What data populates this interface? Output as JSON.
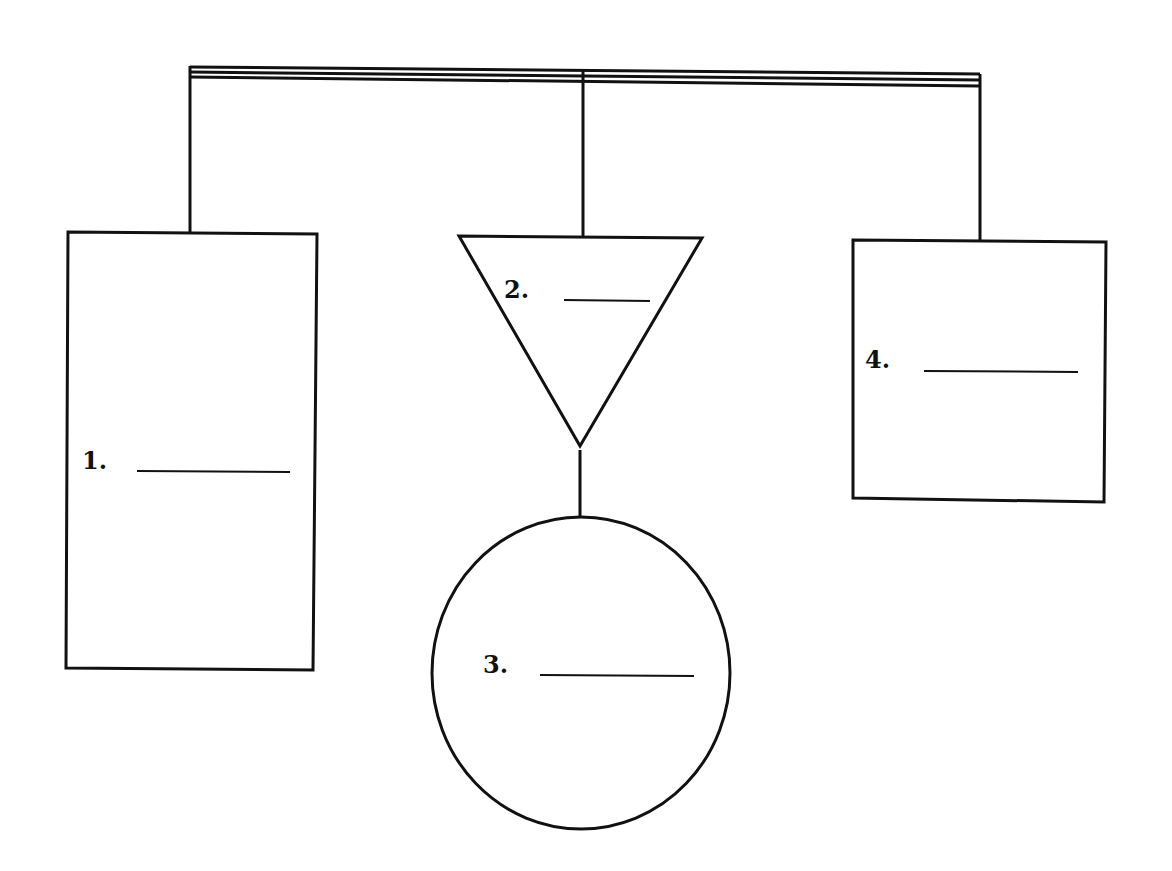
{
  "diagram": {
    "type": "hierarchy-blank-worksheet",
    "shapes": [
      {
        "id": 1,
        "shape": "rectangle",
        "label": "1.",
        "blank": ""
      },
      {
        "id": 2,
        "shape": "inverted-triangle",
        "label": "2.",
        "blank": ""
      },
      {
        "id": 3,
        "shape": "circle",
        "label": "3.",
        "blank": ""
      },
      {
        "id": 4,
        "shape": "square",
        "label": "4.",
        "blank": ""
      }
    ],
    "colors": {
      "line": "#111111",
      "background": "#ffffff"
    }
  }
}
